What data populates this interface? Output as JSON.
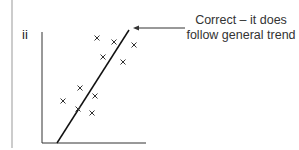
{
  "part_label": "ii",
  "annotation": {
    "line1": "Correct – it does",
    "line2": "follow general trend"
  },
  "chart_data": {
    "type": "scatter",
    "title": "",
    "xlabel": "",
    "ylabel": "",
    "points": [
      [
        97,
        38
      ],
      [
        114,
        42
      ],
      [
        134,
        45
      ],
      [
        103,
        57
      ],
      [
        123,
        62
      ],
      [
        80,
        88
      ],
      [
        63,
        101
      ],
      [
        95,
        96
      ],
      [
        78,
        109
      ],
      [
        92,
        113
      ]
    ],
    "best_fit_line": {
      "from": [
        57,
        143
      ],
      "to": [
        129,
        30
      ]
    },
    "marker": "x"
  }
}
